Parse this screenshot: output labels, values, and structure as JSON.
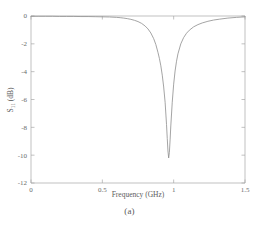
{
  "figure": {
    "caption": "(a)",
    "background_color": "#ffffff"
  },
  "chart_data": {
    "type": "line",
    "title": "",
    "subtitle": "",
    "xlabel": "Frequency (GHz)",
    "ylabel": "S",
    "ylabel_subscript": "11",
    "ylabel_units": " (dB)",
    "ylabel_full": "S11 (dB)",
    "xlim": [
      0,
      1.5
    ],
    "ylim": [
      -12,
      0
    ],
    "xticks": [
      0,
      0.5,
      1,
      1.5
    ],
    "xtick_labels": [
      "0",
      "0.5",
      "1",
      "1.5"
    ],
    "yticks": [
      0,
      -2,
      -4,
      -6,
      -8,
      -10,
      -12
    ],
    "ytick_labels": [
      "0",
      "-2",
      "-4",
      "-6",
      "-8",
      "-10",
      "-12"
    ],
    "grid": false,
    "legend": null,
    "line_color": "#8d8d8d",
    "line_width": 0.8,
    "resonance": {
      "center_frequency_ghz": 0.965,
      "minimum_db": -10.2
    },
    "series": [
      {
        "name": "S11",
        "x": [
          0.0,
          0.05,
          0.1,
          0.15,
          0.2,
          0.25,
          0.3,
          0.35,
          0.4,
          0.45,
          0.5,
          0.55,
          0.6,
          0.625,
          0.65,
          0.675,
          0.7,
          0.725,
          0.75,
          0.775,
          0.8,
          0.82,
          0.84,
          0.86,
          0.875,
          0.89,
          0.9,
          0.91,
          0.92,
          0.93,
          0.94,
          0.95,
          0.955,
          0.96,
          0.965,
          0.97,
          0.975,
          0.98,
          0.99,
          1.0,
          1.01,
          1.02,
          1.03,
          1.05,
          1.07,
          1.09,
          1.11,
          1.14,
          1.17,
          1.2,
          1.24,
          1.28,
          1.32,
          1.38,
          1.44,
          1.5
        ],
        "values": [
          -0.02,
          -0.02,
          -0.02,
          -0.02,
          -0.03,
          -0.03,
          -0.03,
          -0.04,
          -0.04,
          -0.05,
          -0.06,
          -0.07,
          -0.1,
          -0.12,
          -0.15,
          -0.19,
          -0.24,
          -0.31,
          -0.4,
          -0.53,
          -0.72,
          -0.93,
          -1.22,
          -1.63,
          -2.05,
          -2.62,
          -3.05,
          -3.58,
          -4.25,
          -5.1,
          -6.2,
          -7.8,
          -8.8,
          -9.7,
          -10.2,
          -9.8,
          -8.9,
          -7.9,
          -6.2,
          -4.9,
          -3.95,
          -3.25,
          -2.72,
          -2.0,
          -1.55,
          -1.24,
          -1.02,
          -0.78,
          -0.62,
          -0.5,
          -0.38,
          -0.29,
          -0.23,
          -0.15,
          -0.1,
          -0.06
        ]
      }
    ]
  }
}
